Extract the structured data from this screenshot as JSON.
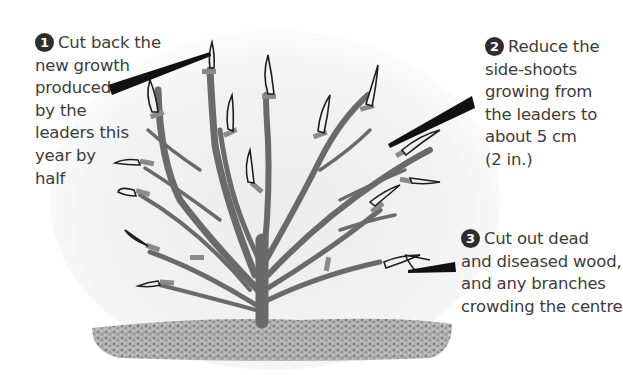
{
  "diagram": {
    "annotations": [
      {
        "number": "1",
        "lines": [
          "Cut back the",
          "new growth",
          "produced",
          "by the",
          "leaders this",
          "year by",
          "half"
        ]
      },
      {
        "number": "2",
        "lines": [
          "Reduce the",
          "side-shoots",
          "growing from",
          "the leaders to",
          "about 5 cm",
          "(2 in.)"
        ]
      },
      {
        "number": "3",
        "lines": [
          "Cut out dead",
          "and diseased wood,",
          "and any branches",
          "crowding the centre"
        ]
      }
    ],
    "colors": {
      "text": "#3c3c3c",
      "number_badge": "#2e2e2e",
      "branch": "#6e6e6e",
      "cut_mark": "#8a8a8a",
      "shoot_outline": "#1e1e1e",
      "ground": "#9a9a9a",
      "pointer": "#111111"
    }
  }
}
